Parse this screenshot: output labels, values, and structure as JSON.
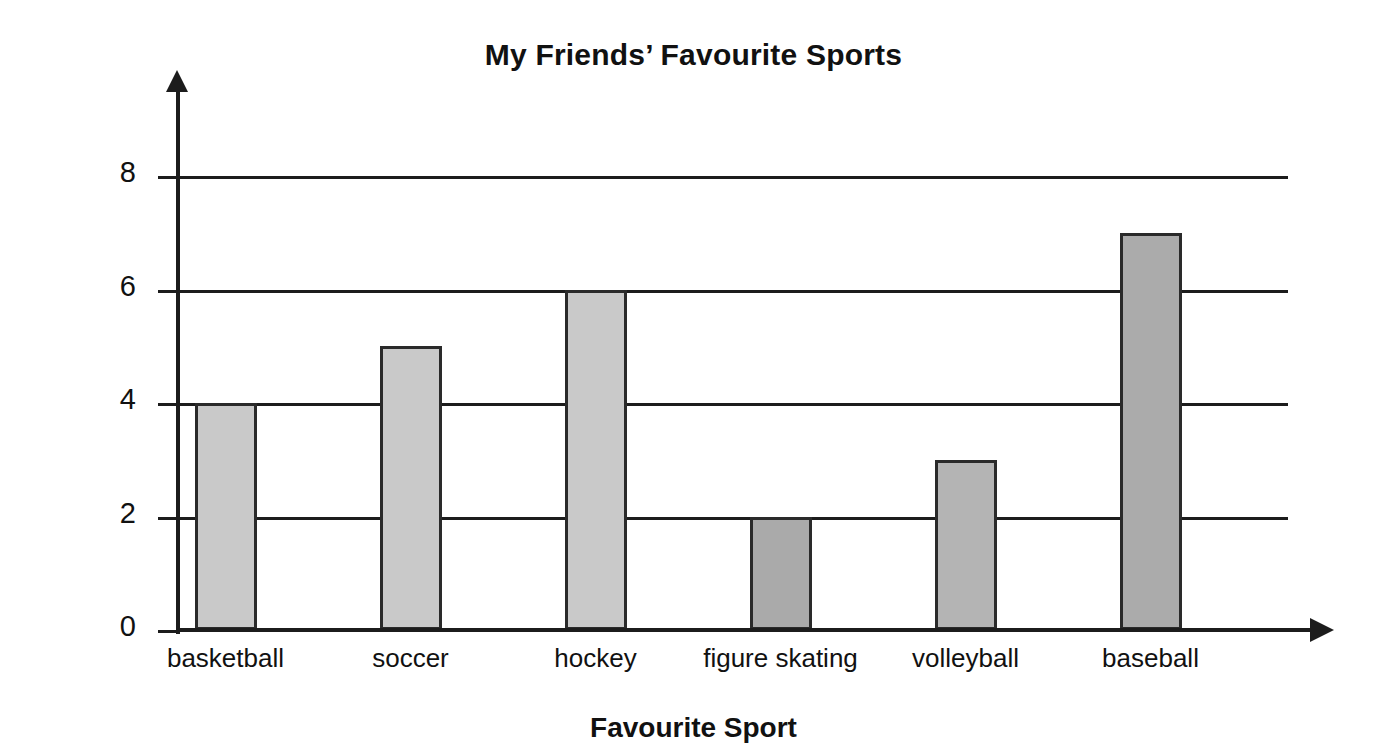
{
  "chart_data": {
    "type": "bar",
    "title": "My Friends’ Favourite Sports",
    "xlabel": "Favourite Sport",
    "ylabel": "Number of Friends",
    "categories": [
      "basketball",
      "soccer",
      "hockey",
      "figure skating",
      "volleyball",
      "baseball"
    ],
    "values": [
      4,
      5,
      6,
      2,
      3,
      7
    ],
    "yticks": [
      "0",
      "2",
      "4",
      "6",
      "8"
    ],
    "ytick_values": [
      0,
      2,
      4,
      6,
      8
    ],
    "ylim": [
      0,
      8
    ],
    "grid": "horizontal",
    "legend": "none",
    "bar_colors": [
      "#c9c9c9",
      "#c9c9c9",
      "#c9c9c9",
      "#aaaaaa",
      "#b4b4b4",
      "#ababab"
    ],
    "bar_border_color": "#2a2a2a",
    "axis_color": "#1c1c1c",
    "background_color": "#ffffff"
  },
  "axes": {
    "y_axis_arrow": "arrow-up-icon",
    "x_axis_arrow": "arrow-right-icon"
  }
}
